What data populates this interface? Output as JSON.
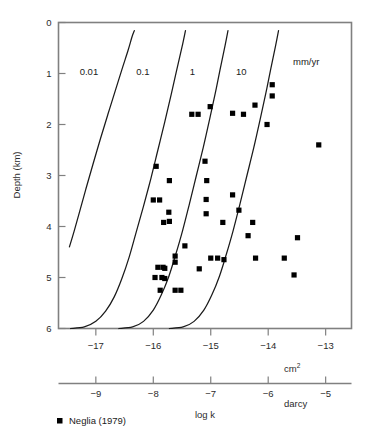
{
  "chart_data": {
    "type": "scatter",
    "title": "",
    "xlabel": "log k",
    "ylabel": "Depth (km)",
    "x_unit_primary": "cm2",
    "x_unit_secondary": "darcy",
    "grid": false,
    "xlim_cm2": [
      -17.65,
      -12.55
    ],
    "ylim_km": [
      0,
      6
    ],
    "y_inverted": true,
    "y_ticks": [
      "0",
      "1",
      "2",
      "3",
      "4",
      "5",
      "6"
    ],
    "y_tick_values": [
      0,
      1,
      2,
      3,
      4,
      5,
      6
    ],
    "x_ticks_cm2": [
      "−17",
      "−16",
      "−15",
      "−14",
      "−13"
    ],
    "x_tick_values_cm2": [
      -17,
      -16,
      -15,
      -14,
      -13
    ],
    "x_ticks_darcy": [
      "−9",
      "−8",
      "−7",
      "−6",
      "−5"
    ],
    "x_tick_values_darcy": [
      -9,
      -8,
      -7,
      -6,
      -5
    ],
    "curve_unit_label": "mm/yr",
    "curves": [
      {
        "label": "0.01",
        "label_x_cm2": -17.12,
        "label_y_km": 0.97,
        "points": [
          [
            -17.46,
            4.4
          ],
          [
            -17.38,
            4.1
          ],
          [
            -17.28,
            3.7
          ],
          [
            -17.17,
            3.25
          ],
          [
            -17.05,
            2.78
          ],
          [
            -16.92,
            2.28
          ],
          [
            -16.79,
            1.8
          ],
          [
            -16.66,
            1.33
          ],
          [
            -16.54,
            0.9
          ],
          [
            -16.44,
            0.55
          ],
          [
            -16.37,
            0.28
          ],
          [
            -16.33,
            0.16
          ]
        ]
      },
      {
        "label": "0.1",
        "label_x_cm2": -16.18,
        "label_y_km": 0.97,
        "points": [
          [
            -17.44,
            6.0
          ],
          [
            -17.2,
            5.97
          ],
          [
            -17.0,
            5.86
          ],
          [
            -16.83,
            5.66
          ],
          [
            -16.68,
            5.38
          ],
          [
            -16.55,
            5.03
          ],
          [
            -16.42,
            4.6
          ],
          [
            -16.3,
            4.12
          ],
          [
            -16.17,
            3.6
          ],
          [
            -16.04,
            3.05
          ],
          [
            -15.92,
            2.5
          ],
          [
            -15.8,
            1.95
          ],
          [
            -15.69,
            1.42
          ],
          [
            -15.59,
            0.92
          ],
          [
            -15.5,
            0.48
          ],
          [
            -15.44,
            0.16
          ]
        ]
      },
      {
        "label": "1",
        "label_x_cm2": -15.32,
        "label_y_km": 0.97,
        "points": [
          [
            -16.6,
            6.0
          ],
          [
            -16.36,
            5.97
          ],
          [
            -16.17,
            5.86
          ],
          [
            -16.0,
            5.64
          ],
          [
            -15.86,
            5.34
          ],
          [
            -15.73,
            4.98
          ],
          [
            -15.61,
            4.55
          ],
          [
            -15.49,
            4.08
          ],
          [
            -15.37,
            3.55
          ],
          [
            -15.25,
            3.0
          ],
          [
            -15.13,
            2.45
          ],
          [
            -15.02,
            1.9
          ],
          [
            -14.92,
            1.38
          ],
          [
            -14.83,
            0.88
          ],
          [
            -14.75,
            0.45
          ],
          [
            -14.7,
            0.16
          ]
        ]
      },
      {
        "label": "10",
        "label_x_cm2": -14.47,
        "label_y_km": 0.97,
        "points": [
          [
            -15.72,
            6.0
          ],
          [
            -15.48,
            5.97
          ],
          [
            -15.29,
            5.86
          ],
          [
            -15.12,
            5.64
          ],
          [
            -14.98,
            5.34
          ],
          [
            -14.85,
            4.98
          ],
          [
            -14.73,
            4.55
          ],
          [
            -14.61,
            4.08
          ],
          [
            -14.49,
            3.55
          ],
          [
            -14.37,
            3.0
          ],
          [
            -14.25,
            2.45
          ],
          [
            -14.14,
            1.9
          ],
          [
            -14.04,
            1.38
          ],
          [
            -13.95,
            0.88
          ],
          [
            -13.87,
            0.45
          ],
          [
            -13.82,
            0.16
          ]
        ]
      }
    ],
    "series": [
      {
        "name": "Neglia (1979)",
        "marker": "square",
        "color": "#000000",
        "points": [
          [
            -13.93,
            1.22
          ],
          [
            -13.93,
            1.44
          ],
          [
            -14.23,
            1.62
          ],
          [
            -14.43,
            1.8
          ],
          [
            -14.62,
            1.78
          ],
          [
            -14.02,
            2.0
          ],
          [
            -15.01,
            1.65
          ],
          [
            -15.22,
            1.8
          ],
          [
            -15.33,
            1.8
          ],
          [
            -13.12,
            2.4
          ],
          [
            -15.95,
            2.82
          ],
          [
            -15.1,
            2.72
          ],
          [
            -15.72,
            3.1
          ],
          [
            -15.07,
            3.1
          ],
          [
            -16.0,
            3.48
          ],
          [
            -15.89,
            3.48
          ],
          [
            -15.08,
            3.47
          ],
          [
            -14.62,
            3.38
          ],
          [
            -15.73,
            3.72
          ],
          [
            -15.08,
            3.75
          ],
          [
            -14.51,
            3.68
          ],
          [
            -15.72,
            3.9
          ],
          [
            -15.82,
            3.92
          ],
          [
            -14.79,
            3.92
          ],
          [
            -14.27,
            3.92
          ],
          [
            -15.45,
            4.38
          ],
          [
            -14.35,
            4.18
          ],
          [
            -13.49,
            4.22
          ],
          [
            -15.62,
            4.58
          ],
          [
            -15.62,
            4.7
          ],
          [
            -15.0,
            4.62
          ],
          [
            -14.88,
            4.62
          ],
          [
            -14.77,
            4.65
          ],
          [
            -14.22,
            4.62
          ],
          [
            -13.72,
            4.62
          ],
          [
            -15.92,
            4.8
          ],
          [
            -15.83,
            4.8
          ],
          [
            -15.8,
            4.82
          ],
          [
            -15.2,
            4.83
          ],
          [
            -15.97,
            5.0
          ],
          [
            -15.85,
            5.0
          ],
          [
            -15.8,
            5.02
          ],
          [
            -13.55,
            4.95
          ],
          [
            -15.88,
            5.25
          ],
          [
            -15.62,
            5.25
          ],
          [
            -15.52,
            5.25
          ]
        ]
      }
    ]
  },
  "legend": {
    "marker_name": "square-marker",
    "entries": [
      {
        "label": "Neglia (1979)",
        "color": "#000000"
      }
    ]
  },
  "axes": {
    "y_title": "Depth (km)",
    "x_title": "log k",
    "unit_primary": "cm",
    "unit_primary_sup": "2",
    "unit_secondary": "darcy"
  },
  "colors": {
    "frame": "#808080",
    "curve": "#1a1a1a",
    "marker": "#000000",
    "text": "#1a1a1a",
    "background": "#ffffff"
  }
}
